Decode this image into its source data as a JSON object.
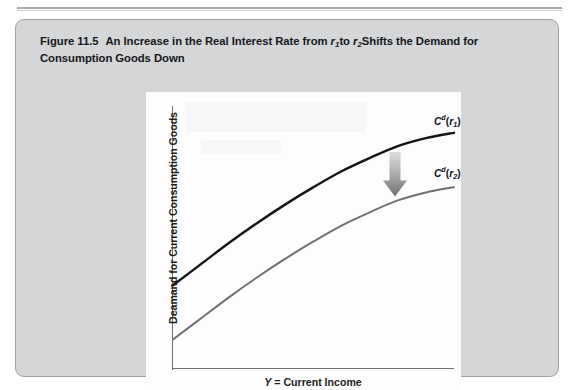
{
  "page": {
    "rule": "horizontal-rule"
  },
  "figure": {
    "number": "Figure 11.5",
    "caption_part1": "An Increase in the Real Interest Rate from ",
    "caption_r1": "r",
    "caption_r1_sub": "1",
    "caption_mid": "to ",
    "caption_r2": "r",
    "caption_r2_sub": "2",
    "caption_part2": "Shifts the Demand for Consumption Goods Down",
    "caption_full": "Figure 11.5 An Increase in the Real Interest Rate from r1to r2Shifts the Demand for Consumption Goods Down",
    "panel_bg": "#d4d6d8",
    "plot_bg": "#fdfdfd"
  },
  "chart_data": {
    "type": "line",
    "xlabel": "Y = Current Income",
    "ylabel": "Deamand for Current Consumption Goods",
    "xlabel_symbol": "Y",
    "xlabel_rest": " = Current Income",
    "grid": false,
    "legend_position": "right-of-curve-ends",
    "axis_ticks": false,
    "xlim": [
      0,
      1
    ],
    "ylim": [
      0,
      1
    ],
    "series": [
      {
        "name": "Cd(r1)",
        "label_base": "C",
        "label_sup": "d",
        "label_arg": "r",
        "label_sub": "1",
        "color": "#121416",
        "width": 2.4,
        "x": [
          0.0,
          0.1,
          0.2,
          0.3,
          0.4,
          0.5,
          0.6,
          0.7,
          0.8,
          0.9,
          1.0
        ],
        "y": [
          0.32,
          0.4,
          0.48,
          0.555,
          0.625,
          0.69,
          0.75,
          0.8,
          0.845,
          0.875,
          0.895
        ]
      },
      {
        "name": "Cd(r2)",
        "label_base": "C",
        "label_sup": "d",
        "label_arg": "r",
        "label_sub": "2",
        "color": "#6e7073",
        "width": 2.0,
        "x": [
          0.0,
          0.1,
          0.2,
          0.3,
          0.4,
          0.5,
          0.6,
          0.7,
          0.8,
          0.9,
          1.0
        ],
        "y": [
          0.115,
          0.195,
          0.275,
          0.35,
          0.42,
          0.485,
          0.545,
          0.595,
          0.64,
          0.67,
          0.69
        ]
      }
    ],
    "annotations": [
      {
        "name": "downward-shift-arrow",
        "type": "arrow",
        "direction": "down",
        "x": 0.79,
        "y_from": 0.845,
        "y_to": 0.655,
        "color_top": "#d9dadc",
        "color_bottom": "#767879"
      }
    ]
  }
}
